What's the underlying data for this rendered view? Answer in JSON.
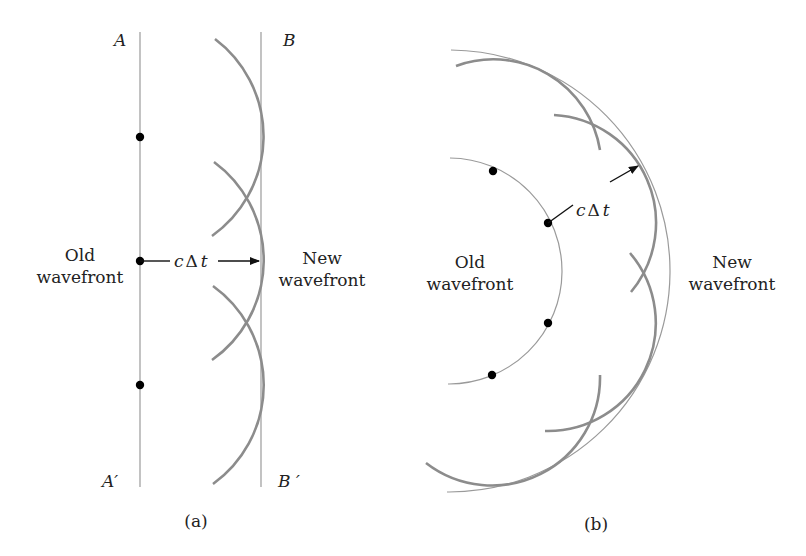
{
  "figure": {
    "panel_a": {
      "caption": "(a)",
      "label_A": "A",
      "label_A_prime": "A′",
      "label_B": "B",
      "label_B_prime": "B ′",
      "old_wavefront_line1": "Old",
      "old_wavefront_line2": "wavefront",
      "new_wavefront_line1": "New",
      "new_wavefront_line2": "wavefront",
      "arrow_label_c": "c",
      "arrow_label_delta": "Δ",
      "arrow_label_t": "t"
    },
    "panel_b": {
      "caption": "(b)",
      "old_wavefront_line1": "Old",
      "old_wavefront_line2": "wavefront",
      "new_wavefront_line1": "New",
      "new_wavefront_line2": "wavefront",
      "arrow_label_c": "c",
      "arrow_label_delta": "Δ",
      "arrow_label_t": "t"
    },
    "colors": {
      "wavelet_stroke": "#8c8c8c",
      "wavefront_stroke": "#9a9a9a",
      "source_dot": "#000000"
    }
  }
}
